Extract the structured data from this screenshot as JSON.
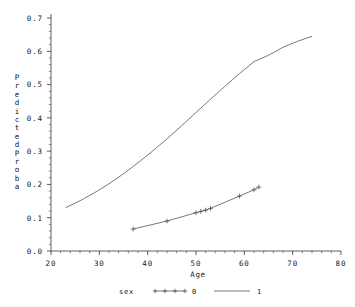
{
  "chart_data": {
    "type": "line",
    "title": "",
    "xlabel": "Age",
    "ylabel": "Predicted Proba",
    "ylabel_chars": [
      "P",
      "r",
      "e",
      "d",
      "i",
      "c",
      "t",
      "e",
      "d",
      "P",
      "r",
      "o",
      "b",
      "a"
    ],
    "xlim": [
      20,
      80
    ],
    "ylim": [
      0.0,
      0.7
    ],
    "xticks": [
      20,
      30,
      40,
      50,
      60,
      70,
      80
    ],
    "xtick_labels": [
      "20",
      "30",
      "40",
      "50",
      "60",
      "70",
      "80"
    ],
    "yticks": [
      0.0,
      0.1,
      0.2,
      0.3,
      0.4,
      0.5,
      0.6,
      0.7
    ],
    "ytick_labels": [
      "0.0",
      "0.1",
      "0.2",
      "0.3",
      "0.4",
      "0.5",
      "0.6",
      "0.7"
    ],
    "grid": false,
    "minor_ticks": true,
    "legend": {
      "title": "sex",
      "position": "bottom",
      "entries": [
        {
          "label": "0",
          "marker": "plus",
          "line": "solid"
        },
        {
          "label": "1",
          "marker": "none",
          "line": "solid"
        }
      ]
    },
    "series": [
      {
        "name": "1",
        "marker": "none",
        "color": "#555555",
        "points": [
          [
            23.0,
            0.13
          ],
          [
            26.0,
            0.151
          ],
          [
            29.0,
            0.175
          ],
          [
            32.0,
            0.202
          ],
          [
            35.0,
            0.232
          ],
          [
            38.0,
            0.265
          ],
          [
            41.0,
            0.3
          ],
          [
            44.0,
            0.337
          ],
          [
            47.0,
            0.376
          ],
          [
            50.0,
            0.416
          ],
          [
            53.0,
            0.456
          ],
          [
            56.0,
            0.495
          ],
          [
            59.0,
            0.533
          ],
          [
            62.0,
            0.569
          ],
          [
            65.0,
            0.588
          ],
          [
            68.0,
            0.612
          ],
          [
            71.0,
            0.63
          ],
          [
            74.0,
            0.645
          ]
        ]
      },
      {
        "name": "0",
        "marker": "plus",
        "color": "#555555",
        "points": [
          [
            37.0,
            0.066
          ],
          [
            44.0,
            0.09
          ],
          [
            50.0,
            0.115
          ],
          [
            51.0,
            0.119
          ],
          [
            52.0,
            0.123
          ],
          [
            53.0,
            0.128
          ],
          [
            59.0,
            0.165
          ],
          [
            62.0,
            0.184
          ],
          [
            63.0,
            0.192
          ]
        ],
        "marker_points": [
          [
            37.0,
            0.066
          ],
          [
            44.0,
            0.09
          ],
          [
            50.0,
            0.115
          ],
          [
            51.0,
            0.119
          ],
          [
            52.0,
            0.123
          ],
          [
            53.0,
            0.128
          ],
          [
            59.0,
            0.165
          ],
          [
            62.0,
            0.184
          ],
          [
            63.0,
            0.192
          ]
        ]
      }
    ]
  }
}
